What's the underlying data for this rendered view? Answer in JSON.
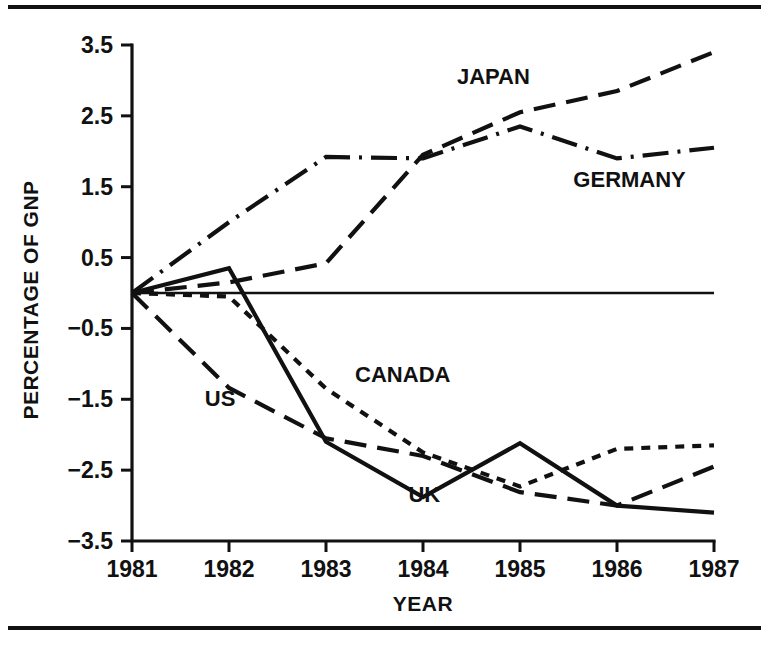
{
  "figure": {
    "background_color": "#ffffff",
    "ink_color": "#111111",
    "has_top_rule": true,
    "has_bottom_rule": true
  },
  "chart_data": {
    "type": "line",
    "title": "",
    "xlabel": "YEAR",
    "ylabel": "PERCENTAGE OF GNP",
    "x": [
      1981,
      1982,
      1983,
      1984,
      1985,
      1986,
      1987
    ],
    "xtick_labels": [
      "1981",
      "1982",
      "1983",
      "1984",
      "1985",
      "1986",
      "1987"
    ],
    "ytick_labels": [
      "3.5",
      "2.5",
      "1.5",
      "0.5",
      "−0.5",
      "−1.5",
      "−2.5",
      "−3.5"
    ],
    "ytick_values": [
      3.5,
      2.5,
      1.5,
      0.5,
      -0.5,
      -1.5,
      -2.5,
      -3.5
    ],
    "xlim": [
      1981,
      1987
    ],
    "ylim": [
      -3.5,
      3.5
    ],
    "grid": false,
    "legend": "inline-labels",
    "zero_reference_line": 0,
    "series": [
      {
        "name": "JAPAN",
        "style": "dashed",
        "label_x": 1984.35,
        "label_y": 2.95,
        "values": [
          0.0,
          0.15,
          0.42,
          1.95,
          2.55,
          2.85,
          3.4
        ]
      },
      {
        "name": "GERMANY",
        "style": "dashdot",
        "label_x": 1985.55,
        "label_y": 1.5,
        "values": [
          0.0,
          1.0,
          1.92,
          1.9,
          2.35,
          1.9,
          2.05
        ]
      },
      {
        "name": "CANADA",
        "style": "dotted",
        "label_x": 1983.3,
        "label_y": -1.25,
        "values": [
          0.0,
          -0.05,
          -1.35,
          -2.25,
          -2.73,
          -2.2,
          -2.15
        ]
      },
      {
        "name": "US",
        "style": "dashed",
        "label_x": 1981.75,
        "label_y": -1.6,
        "values": [
          0.0,
          -1.34,
          -2.05,
          -2.3,
          -2.81,
          -3.0,
          -2.45
        ]
      },
      {
        "name": "UK",
        "style": "solid",
        "label_x": 1983.85,
        "label_y": -2.95,
        "values": [
          0.0,
          0.35,
          -2.1,
          -2.88,
          -2.12,
          -3.0,
          -3.1
        ]
      }
    ]
  }
}
